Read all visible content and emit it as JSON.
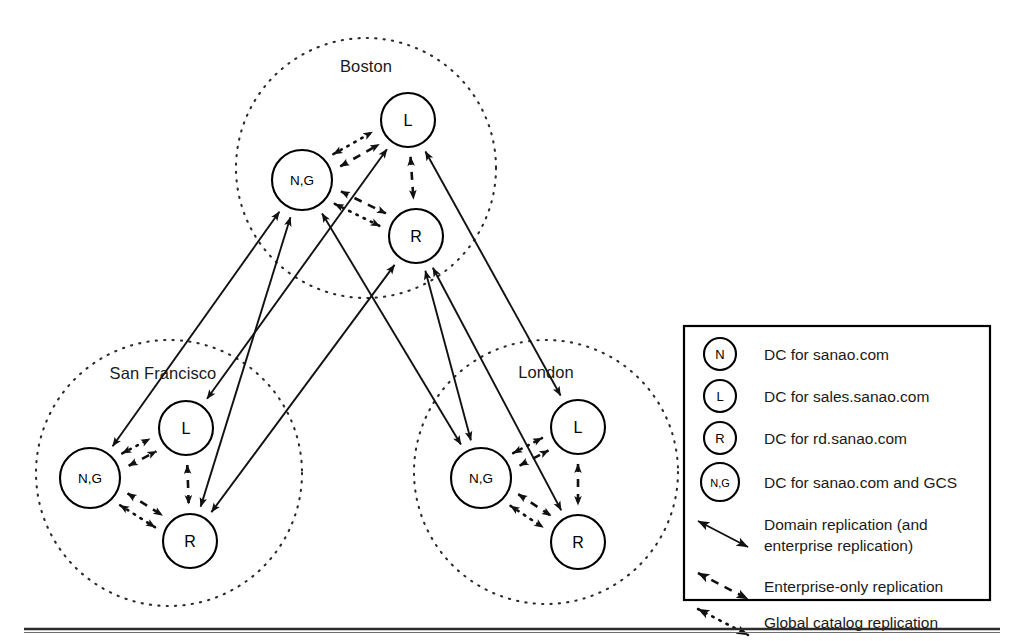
{
  "figure": {
    "background": "#ffffff",
    "line_color": "#111111"
  },
  "sites": [
    {
      "id": "boston",
      "label": "Boston",
      "center": [
        366,
        168
      ],
      "radius": 130,
      "label_pos": [
        366,
        72
      ],
      "nodes": [
        {
          "id": "boston-ng",
          "label": "N,G",
          "cx": 302,
          "cy": 180,
          "r": 30,
          "small": true
        },
        {
          "id": "boston-l",
          "label": "L",
          "cx": 408,
          "cy": 120,
          "r": 27,
          "small": false
        },
        {
          "id": "boston-r",
          "label": "R",
          "cx": 416,
          "cy": 236,
          "r": 27,
          "small": false
        }
      ]
    },
    {
      "id": "san-francisco",
      "label": "San Francisco",
      "center": [
        169,
        473
      ],
      "radius": 133,
      "label_pos": [
        163,
        379
      ],
      "nodes": [
        {
          "id": "sf-ng",
          "label": "N,G",
          "cx": 90,
          "cy": 478,
          "r": 30,
          "small": true
        },
        {
          "id": "sf-l",
          "label": "L",
          "cx": 186,
          "cy": 428,
          "r": 27,
          "small": false
        },
        {
          "id": "sf-r",
          "label": "R",
          "cx": 190,
          "cy": 541,
          "r": 27,
          "small": false
        }
      ]
    },
    {
      "id": "london",
      "label": "London",
      "center": [
        546,
        472
      ],
      "radius": 132,
      "label_pos": [
        546,
        378
      ],
      "nodes": [
        {
          "id": "london-ng",
          "label": "N,G",
          "cx": 481,
          "cy": 478,
          "r": 30,
          "small": true
        },
        {
          "id": "london-l",
          "label": "L",
          "cx": 578,
          "cy": 427,
          "r": 27,
          "small": false
        },
        {
          "id": "london-r",
          "label": "R",
          "cx": 578,
          "cy": 542,
          "r": 27,
          "small": false
        }
      ]
    }
  ],
  "intra_site_links": [
    {
      "site": "boston",
      "from": "boston-ng",
      "to": "boston-l",
      "style": "dashed",
      "offset": 7
    },
    {
      "site": "boston",
      "from": "boston-ng",
      "to": "boston-l",
      "style": "dotted",
      "offset": -7
    },
    {
      "site": "boston",
      "from": "boston-ng",
      "to": "boston-r",
      "style": "dashed",
      "offset": -7
    },
    {
      "site": "boston",
      "from": "boston-ng",
      "to": "boston-r",
      "style": "dotted",
      "offset": 7
    },
    {
      "site": "boston",
      "from": "boston-l",
      "to": "boston-r",
      "style": "dashed",
      "offset": 0
    },
    {
      "site": "san-francisco",
      "from": "sf-ng",
      "to": "sf-l",
      "style": "dashed",
      "offset": 7
    },
    {
      "site": "san-francisco",
      "from": "sf-ng",
      "to": "sf-l",
      "style": "dotted",
      "offset": -7
    },
    {
      "site": "san-francisco",
      "from": "sf-ng",
      "to": "sf-r",
      "style": "dashed",
      "offset": -7
    },
    {
      "site": "san-francisco",
      "from": "sf-ng",
      "to": "sf-r",
      "style": "dotted",
      "offset": 7
    },
    {
      "site": "san-francisco",
      "from": "sf-l",
      "to": "sf-r",
      "style": "dashed",
      "offset": 0
    },
    {
      "site": "london",
      "from": "london-ng",
      "to": "london-l",
      "style": "dashed",
      "offset": 7
    },
    {
      "site": "london",
      "from": "london-ng",
      "to": "london-l",
      "style": "dotted",
      "offset": -7
    },
    {
      "site": "london",
      "from": "london-ng",
      "to": "london-r",
      "style": "dashed",
      "offset": -7
    },
    {
      "site": "london",
      "from": "london-ng",
      "to": "london-r",
      "style": "dotted",
      "offset": 7
    },
    {
      "site": "london",
      "from": "london-l",
      "to": "london-r",
      "style": "dashed",
      "offset": 0
    }
  ],
  "inter_site_links": [
    {
      "from": "boston-ng",
      "to": "sf-ng",
      "style": "solid"
    },
    {
      "from": "boston-ng",
      "to": "sf-r",
      "style": "solid"
    },
    {
      "from": "boston-ng",
      "to": "london-ng",
      "style": "solid"
    },
    {
      "from": "boston-l",
      "to": "sf-l",
      "style": "solid"
    },
    {
      "from": "boston-l",
      "to": "london-l",
      "style": "solid"
    },
    {
      "from": "boston-r",
      "to": "sf-r",
      "style": "solid"
    },
    {
      "from": "boston-r",
      "to": "london-r",
      "style": "solid"
    },
    {
      "from": "boston-r",
      "to": "london-ng",
      "style": "solid"
    }
  ],
  "legend": {
    "box": {
      "x": 684,
      "y": 326,
      "width": 306,
      "height": 274
    },
    "node_entries": [
      {
        "icon": "node-n",
        "symbol": "N",
        "small": false,
        "text": "DC for sanao.com"
      },
      {
        "icon": "node-l",
        "symbol": "L",
        "small": false,
        "text": "DC for sales.sanao.com"
      },
      {
        "icon": "node-r",
        "symbol": "R",
        "small": false,
        "text": "DC for rd.sanao.com"
      },
      {
        "icon": "node-ng",
        "symbol": "N,G",
        "small": true,
        "text": "DC for sanao.com and GCS"
      }
    ],
    "line_entries": [
      {
        "icon": "arrow-solid",
        "style": "solid",
        "lines": [
          "Domain replication (and",
          "enterprise replication)"
        ]
      },
      {
        "icon": "arrow-dashed",
        "style": "dashed",
        "lines": [
          "Enterprise-only replication"
        ]
      },
      {
        "icon": "arrow-dotted",
        "style": "dotted",
        "lines": [
          "Global catalog replication"
        ]
      }
    ]
  },
  "footer_rule": {
    "y": 629,
    "x1": 24,
    "x2": 1000
  }
}
